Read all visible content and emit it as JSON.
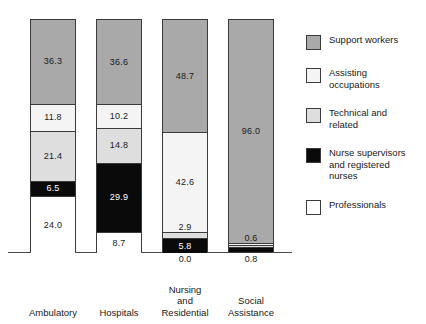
{
  "chart_data": {
    "type": "bar",
    "subtype": "stacked-bar-100",
    "title": "",
    "xlabel": "",
    "ylabel": "",
    "ylim": [
      0,
      100
    ],
    "grid": false,
    "legend_position": "right",
    "categories": [
      "Ambulatory",
      "Hospitals",
      "Nursing and Residential",
      "Social Assistance"
    ],
    "category_label_lines": [
      [
        "Ambulatory"
      ],
      [
        "Hospitals"
      ],
      [
        "Nursing",
        "and",
        "Residential"
      ],
      [
        "Social",
        "Assistance"
      ]
    ],
    "series": [
      {
        "name": "Support workers",
        "color": "#a9a9a9",
        "pattern": "solid-gray",
        "values": [
          36.3,
          36.6,
          48.7,
          96.0
        ]
      },
      {
        "name": "Assisting occupations",
        "color": "#f4f4f4",
        "pattern": "dotted",
        "values": [
          11.8,
          10.2,
          42.6,
          0.6
        ]
      },
      {
        "name": "Technical and related",
        "color": "#dedede",
        "pattern": "solid-light-gray",
        "values": [
          21.4,
          14.8,
          2.9,
          0.6
        ]
      },
      {
        "name": "Nurse supervisors and registered nurses",
        "color": "#0a0a0a",
        "pattern": "solid-black",
        "values": [
          6.5,
          29.9,
          5.8,
          2.0
        ]
      },
      {
        "name": "Professionals",
        "color": "#ffffff",
        "pattern": "solid-white",
        "values": [
          24.0,
          8.7,
          0.0,
          0.8
        ]
      }
    ],
    "below_axis_labels": [
      {
        "category": "Nursing and Residential",
        "value": "0.0"
      },
      {
        "category": "Social Assistance",
        "value": "0.8"
      }
    ]
  },
  "bars": [
    {
      "name": "Ambulatory",
      "label_lines": [
        "Ambulatory"
      ],
      "segments": [
        {
          "series": "Support workers",
          "value": "36.3",
          "label_tone": "dark",
          "show_label": true
        },
        {
          "series": "Assisting occupations",
          "value": "11.8",
          "label_tone": "dark",
          "show_label": true
        },
        {
          "series": "Technical and related",
          "value": "21.4",
          "label_tone": "dark",
          "show_label": true
        },
        {
          "series": "Nurse supervisors and registered nurses",
          "value": "6.5",
          "label_tone": "light",
          "show_label": true
        },
        {
          "series": "Professionals",
          "value": "24.0",
          "label_tone": "dark",
          "show_label": true
        }
      ],
      "below_value": ""
    },
    {
      "name": "Hospitals",
      "label_lines": [
        "Hospitals"
      ],
      "segments": [
        {
          "series": "Support workers",
          "value": "36.6",
          "label_tone": "dark",
          "show_label": true
        },
        {
          "series": "Assisting occupations",
          "value": "10.2",
          "label_tone": "dark",
          "show_label": true
        },
        {
          "series": "Technical and related",
          "value": "14.8",
          "label_tone": "dark",
          "show_label": true
        },
        {
          "series": "Nurse supervisors and registered nurses",
          "value": "29.9",
          "label_tone": "light",
          "show_label": true
        },
        {
          "series": "Professionals",
          "value": "8.7",
          "label_tone": "dark",
          "show_label": true
        }
      ],
      "below_value": ""
    },
    {
      "name": "Nursing and Residential",
      "label_lines": [
        "Nursing",
        "and",
        "Residential"
      ],
      "segments": [
        {
          "series": "Support workers",
          "value": "48.7",
          "label_tone": "dark",
          "show_label": true
        },
        {
          "series": "Assisting occupations",
          "value": "42.6",
          "label_tone": "dark",
          "show_label": true
        },
        {
          "series": "Technical and related",
          "value": "2.9",
          "label_tone": "dark",
          "show_label": true
        },
        {
          "series": "Nurse supervisors and registered nurses",
          "value": "5.8",
          "label_tone": "light",
          "show_label": true
        },
        {
          "series": "Professionals",
          "value": "0.0",
          "label_tone": "dark",
          "show_label": false
        }
      ],
      "below_value": "0.0"
    },
    {
      "name": "Social Assistance",
      "label_lines": [
        "Social",
        "Assistance"
      ],
      "segments": [
        {
          "series": "Support workers",
          "value": "96.0",
          "label_tone": "dark",
          "show_label": true
        },
        {
          "series": "Assisting occupations",
          "value": "0.6",
          "label_tone": "dark",
          "show_label": true
        },
        {
          "series": "Technical and related",
          "value": "0.6",
          "label_tone": "dark",
          "show_label": false
        },
        {
          "series": "Nurse supervisors and registered nurses",
          "value": "2.0",
          "label_tone": "light",
          "show_label": false
        },
        {
          "series": "Professionals",
          "value": "0.8",
          "label_tone": "dark",
          "show_label": false
        }
      ],
      "below_value": "0.8"
    }
  ],
  "legend": {
    "items": [
      {
        "label": "Support workers",
        "swatch": "support-workers-swatch"
      },
      {
        "label": "Assisting occupations",
        "swatch": "assisting-occupations-swatch"
      },
      {
        "label": "Technical and related",
        "swatch": "technical-and-related-swatch"
      },
      {
        "label": "Nurse supervisors and registered nurses",
        "swatch": "nurse-supervisors-swatch"
      },
      {
        "label": "Professionals",
        "swatch": "professionals-swatch"
      }
    ],
    "items_lines": [
      [
        "Support workers"
      ],
      [
        "Assisting",
        "occupations"
      ],
      [
        "Technical and",
        "related"
      ],
      [
        "Nurse supervisors",
        "and registered",
        "nurses"
      ],
      [
        "Professionals"
      ]
    ]
  }
}
